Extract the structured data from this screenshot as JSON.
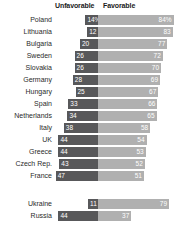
{
  "header": {
    "unfavorable_label": "Unfavorable",
    "favorable_label": "Favorable"
  },
  "colors": {
    "unfavorable": "#58585a",
    "favorable": "#b0b0b0",
    "background": "#ffffff",
    "label_text": "#2b2b2b",
    "value_text": "#ffffff"
  },
  "chart_data": {
    "type": "bar",
    "title": "",
    "subtitle": "",
    "xlabel": "",
    "ylabel": "",
    "orientation": "horizontal",
    "layout": "diverging",
    "grid": false,
    "legend_position": "top",
    "axis_center": "shared baseline between Unfavorable (left) and Favorable (right)",
    "categories": [
      "Poland",
      "Lithuania",
      "Bulgaria",
      "Sweden",
      "Slovakia",
      "Germany",
      "Hungary",
      "Spain",
      "Netherlands",
      "Italy",
      "UK",
      "Greece",
      "Czech Rep.",
      "France",
      "Ukraine",
      "Russia"
    ],
    "series": [
      {
        "name": "Unfavorable",
        "color": "#58585a",
        "values": [
          14,
          12,
          20,
          26,
          26,
          28,
          25,
          33,
          34,
          38,
          44,
          44,
          43,
          47,
          11,
          44
        ]
      },
      {
        "name": "Favorable",
        "color": "#b0b0b0",
        "values": [
          84,
          83,
          77,
          72,
          70,
          69,
          67,
          66,
          65,
          58,
          54,
          53,
          52,
          51,
          79,
          37
        ]
      }
    ],
    "group_breaks": [
      14
    ],
    "rows": [
      {
        "label": "Poland",
        "unfavorable": 14,
        "favorable": 84,
        "unfavorable_text": "14%",
        "favorable_text": "84%"
      },
      {
        "label": "Lithuania",
        "unfavorable": 12,
        "favorable": 83,
        "unfavorable_text": "12",
        "favorable_text": "83"
      },
      {
        "label": "Bulgaria",
        "unfavorable": 20,
        "favorable": 77,
        "unfavorable_text": "20",
        "favorable_text": "77"
      },
      {
        "label": "Sweden",
        "unfavorable": 26,
        "favorable": 72,
        "unfavorable_text": "26",
        "favorable_text": "72"
      },
      {
        "label": "Slovakia",
        "unfavorable": 26,
        "favorable": 70,
        "unfavorable_text": "26",
        "favorable_text": "70"
      },
      {
        "label": "Germany",
        "unfavorable": 28,
        "favorable": 69,
        "unfavorable_text": "28",
        "favorable_text": "69"
      },
      {
        "label": "Hungary",
        "unfavorable": 25,
        "favorable": 67,
        "unfavorable_text": "25",
        "favorable_text": "67"
      },
      {
        "label": "Spain",
        "unfavorable": 33,
        "favorable": 66,
        "unfavorable_text": "33",
        "favorable_text": "66"
      },
      {
        "label": "Netherlands",
        "unfavorable": 34,
        "favorable": 65,
        "unfavorable_text": "34",
        "favorable_text": "65"
      },
      {
        "label": "Italy",
        "unfavorable": 38,
        "favorable": 58,
        "unfavorable_text": "38",
        "favorable_text": "58"
      },
      {
        "label": "UK",
        "unfavorable": 44,
        "favorable": 54,
        "unfavorable_text": "44",
        "favorable_text": "54"
      },
      {
        "label": "Greece",
        "unfavorable": 44,
        "favorable": 53,
        "unfavorable_text": "44",
        "favorable_text": "53"
      },
      {
        "label": "Czech Rep.",
        "unfavorable": 43,
        "favorable": 52,
        "unfavorable_text": "43",
        "favorable_text": "52"
      },
      {
        "label": "France",
        "unfavorable": 47,
        "favorable": 51,
        "unfavorable_text": "47",
        "favorable_text": "51"
      },
      {
        "label": "Ukraine",
        "unfavorable": 11,
        "favorable": 79,
        "unfavorable_text": "11",
        "favorable_text": "79"
      },
      {
        "label": "Russia",
        "unfavorable": 44,
        "favorable": 37,
        "unfavorable_text": "44",
        "favorable_text": "37"
      }
    ]
  }
}
